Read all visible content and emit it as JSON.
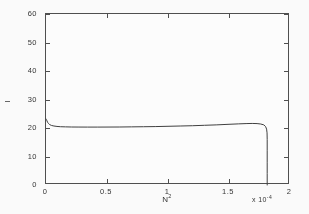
{
  "figure": {
    "background_color": "#fdfdfd",
    "axes_color": "#4a4a4a",
    "curve_color": "#3a3a3a"
  },
  "chart_data": {
    "type": "line",
    "title": "",
    "subtitle": "",
    "xlabel": "N²",
    "xlabel_base": "N",
    "xlabel_sup": "2",
    "ylabel": "I",
    "x_multiplier": "x 10",
    "x_multiplier_exp": "-4",
    "x_multiplier_full": "x 10⁻⁴",
    "xlim": [
      0,
      2
    ],
    "ylim": [
      0,
      60
    ],
    "xticks": [
      0,
      0.5,
      1,
      1.5,
      2
    ],
    "xtick_labels": [
      "0",
      "0.5",
      "1",
      "1.5",
      "2"
    ],
    "yticks": [
      0,
      10,
      20,
      30,
      40,
      50,
      60
    ],
    "ytick_labels": [
      "0",
      "10",
      "20",
      "30",
      "40",
      "50",
      "60"
    ],
    "grid": false,
    "legend": null,
    "series": [
      {
        "name": "I vs N²",
        "x": [
          0.0,
          0.004,
          0.008,
          0.013,
          0.02,
          0.03,
          0.045,
          0.065,
          0.09,
          0.12,
          0.16,
          0.21,
          0.27,
          0.34,
          0.42,
          0.5,
          0.6,
          0.7,
          0.8,
          0.9,
          1.0,
          1.1,
          1.2,
          1.3,
          1.4,
          1.5,
          1.58,
          1.64,
          1.69,
          1.73,
          1.76,
          1.785,
          1.8,
          1.808,
          1.812,
          1.813,
          1.813,
          1.813,
          1.813,
          1.813
        ],
        "y": [
          23.2,
          22.9,
          22.5,
          22.0,
          21.6,
          21.2,
          20.9,
          20.7,
          20.55,
          20.45,
          20.4,
          20.35,
          20.33,
          20.32,
          20.32,
          20.33,
          20.35,
          20.4,
          20.45,
          20.5,
          20.6,
          20.7,
          20.8,
          20.95,
          21.1,
          21.3,
          21.45,
          21.55,
          21.6,
          21.55,
          21.4,
          21.1,
          20.5,
          19.6,
          18.3,
          16.0,
          12.0,
          8.0,
          4.0,
          0.0
        ]
      }
    ],
    "annotations": []
  },
  "axis": {
    "frame_left_px": 45,
    "frame_top_px": 13,
    "frame_width_px": 244,
    "frame_height_px": 171
  }
}
